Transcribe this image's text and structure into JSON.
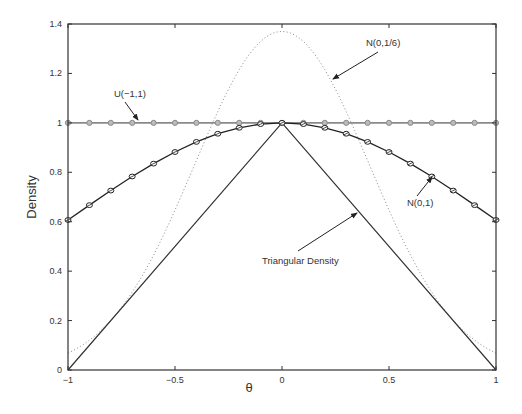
{
  "chart_data": {
    "type": "line",
    "title": "",
    "xlabel": "θ",
    "ylabel": "Density",
    "xlim": [
      -1,
      1
    ],
    "ylim": [
      0,
      1.4
    ],
    "grid": false,
    "legend": "none (inline annotations with arrows)",
    "x_ticks": [
      "-1",
      "-0.5",
      "0",
      "0.5",
      "1"
    ],
    "y_ticks": [
      "0",
      "0.2",
      "0.4",
      "0.6",
      "0.8",
      "1",
      "1.2",
      "1.4"
    ],
    "x": [
      -1.0,
      -0.9,
      -0.8,
      -0.7,
      -0.6,
      -0.5,
      -0.4,
      -0.3,
      -0.2,
      -0.1,
      0.0,
      0.1,
      0.2,
      0.3,
      0.4,
      0.5,
      0.6,
      0.7,
      0.8,
      0.9,
      1.0
    ],
    "series": [
      {
        "name": "U(-1,1)",
        "style": "gray solid line with circle markers",
        "values": [
          1,
          1,
          1,
          1,
          1,
          1,
          1,
          1,
          1,
          1,
          1,
          1,
          1,
          1,
          1,
          1,
          1,
          1,
          1,
          1,
          1
        ]
      },
      {
        "name": "N(0,1)",
        "style": "black solid line with crossed-circle markers",
        "values": [
          0.607,
          0.667,
          0.726,
          0.783,
          0.835,
          0.882,
          0.923,
          0.956,
          0.98,
          0.995,
          1.0,
          0.995,
          0.98,
          0.956,
          0.923,
          0.882,
          0.835,
          0.783,
          0.726,
          0.667,
          0.607
        ]
      },
      {
        "name": "N(0,1/6)",
        "style": "gray dotted line",
        "values": [
          0.068,
          0.12,
          0.2,
          0.316,
          0.467,
          0.65,
          0.849,
          1.043,
          1.208,
          1.32,
          1.37,
          1.32,
          1.208,
          1.043,
          0.849,
          0.65,
          0.467,
          0.316,
          0.2,
          0.12,
          0.068
        ]
      },
      {
        "name": "Triangular Density",
        "style": "dark solid line",
        "values": [
          0.0,
          0.1,
          0.2,
          0.3,
          0.4,
          0.5,
          0.6,
          0.7,
          0.8,
          0.9,
          1.0,
          0.9,
          0.8,
          0.7,
          0.6,
          0.5,
          0.4,
          0.3,
          0.2,
          0.1,
          0.0
        ]
      }
    ],
    "annotations": [
      {
        "text": "U(-1,1)",
        "label_at": [
          -0.65,
          1.085
        ],
        "arrow_to": [
          -0.57,
          1.0
        ]
      },
      {
        "text": "N(0,1/6)",
        "label_at": [
          0.62,
          1.29
        ],
        "arrow_to": [
          0.33,
          1.12
        ]
      },
      {
        "text": "N(0,1)",
        "label_at": [
          0.63,
          0.67
        ],
        "arrow_to": [
          0.7,
          0.785
        ]
      },
      {
        "text": "Triangular Density",
        "label_at": [
          0.18,
          0.48
        ],
        "arrow_to": [
          0.47,
          0.565
        ]
      }
    ]
  },
  "labels": {
    "xlabel": "θ",
    "ylabel": "Density",
    "annot_u": "U(−1,1)",
    "annot_n16": "N(0,1/6)",
    "annot_n01": "N(0,1)",
    "annot_tri": "Triangular Density",
    "x_ticks": [
      "−1",
      "−0.5",
      "0",
      "0.5",
      "1"
    ],
    "y_ticks": [
      "0",
      "0.2",
      "0.4",
      "0.6",
      "0.8",
      "1",
      "1.2",
      "1.4"
    ]
  },
  "colors": {
    "uniform": "#8a8a8a",
    "normal1": "#222222",
    "normal16": "#9a9a9a",
    "triangular": "#333333",
    "axis": "#333333"
  }
}
